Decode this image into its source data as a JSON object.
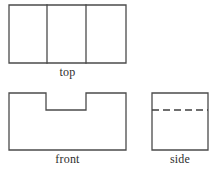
{
  "drawing": {
    "kind": "orthographic-projection",
    "background_color": "#ffffff",
    "line_color": "#4b4b4b",
    "hidden_line_color": "#3f3f3f",
    "label_color": "#2e2e2e",
    "views": [
      {
        "id": "top",
        "label": "top",
        "shape": "rectangle-with-two-vertical-dividers",
        "outline_points": "9,5 126,5 126,63 9,63",
        "divider_lines": [
          {
            "id": "top-divider-left",
            "points": "47,5 47,63"
          },
          {
            "id": "top-divider-right",
            "points": "86,5 86,63"
          }
        ],
        "hidden_lines": []
      },
      {
        "id": "front",
        "label": "front",
        "shape": "rectangle-with-top-center-notch",
        "outline_points": "9,93 46,93 46,110 86,110 86,93 126,93 126,150 9,150",
        "divider_lines": [],
        "hidden_lines": []
      },
      {
        "id": "side",
        "label": "side",
        "shape": "rectangle-with-horizontal-hidden-line",
        "outline_points": "152,93 208,93 208,150 152,150",
        "divider_lines": [],
        "hidden_lines": [
          {
            "id": "side-hidden-edge",
            "points": "152,110 208,110"
          }
        ]
      }
    ]
  }
}
